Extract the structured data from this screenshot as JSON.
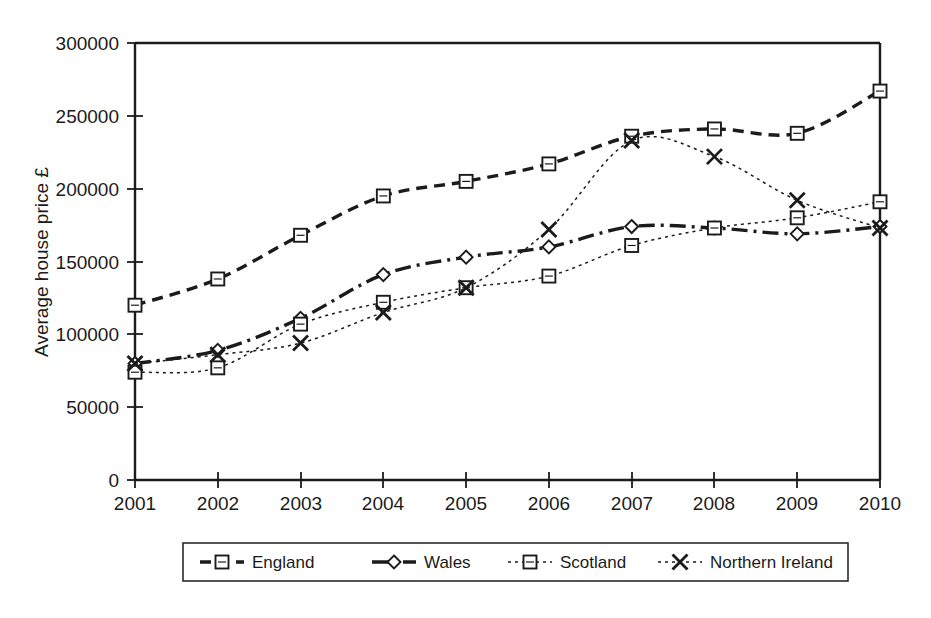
{
  "chart_data": {
    "type": "line",
    "title": "",
    "xlabel": "",
    "ylabel": "Average house price £",
    "x": [
      2001,
      2002,
      2003,
      2004,
      2005,
      2006,
      2007,
      2008,
      2009,
      2010
    ],
    "xtick_labels": [
      "2001",
      "2002",
      "2003",
      "2004",
      "2005",
      "2006",
      "2007",
      "2008",
      "2009",
      "2010"
    ],
    "ytick_labels": [
      "0",
      "50000",
      "100000",
      "150000",
      "200000",
      "250000",
      "300000"
    ],
    "yticks": [
      0,
      50000,
      100000,
      150000,
      200000,
      250000,
      300000
    ],
    "ylim": [
      0,
      300000
    ],
    "xlim": [
      2001,
      2010
    ],
    "grid": false,
    "legend_position": "bottom",
    "series": [
      {
        "name": "England",
        "marker": "square",
        "linestyle": "dashed",
        "values": [
          120000,
          138000,
          168000,
          195000,
          205000,
          217000,
          236000,
          241000,
          238000,
          267000
        ]
      },
      {
        "name": "Wales",
        "marker": "diamond",
        "linestyle": "dash-dot",
        "values": [
          80000,
          89000,
          111000,
          141000,
          153000,
          160000,
          174000,
          173000,
          169000,
          174000
        ]
      },
      {
        "name": "Scotland",
        "marker": "square",
        "linestyle": "dotted",
        "values": [
          74000,
          77000,
          107000,
          122000,
          132000,
          140000,
          161000,
          173000,
          180000,
          191000
        ]
      },
      {
        "name": "Northern Ireland",
        "marker": "cross",
        "linestyle": "dotted",
        "values": [
          80000,
          86000,
          94000,
          115000,
          132000,
          172000,
          233000,
          222000,
          192000,
          173000
        ]
      }
    ]
  },
  "axis": {
    "y_title": "Average house price £",
    "y_labels": [
      "300000",
      "250000",
      "200000",
      "150000",
      "100000",
      "50000",
      "0"
    ],
    "x_labels": [
      "2001",
      "2002",
      "2003",
      "2004",
      "2005",
      "2006",
      "2007",
      "2008",
      "2009",
      "2010"
    ]
  },
  "legend": {
    "entries": [
      {
        "label": "England"
      },
      {
        "label": "Wales"
      },
      {
        "label": "Scotland"
      },
      {
        "label": "Northern Ireland"
      }
    ]
  },
  "colors": {
    "ink": "#1b1b1b",
    "background": "#ffffff"
  }
}
